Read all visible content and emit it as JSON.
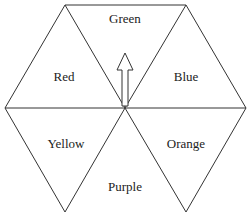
{
  "diagram": {
    "type": "hexagon-of-triangles",
    "colors": {
      "line": "#333333",
      "text": "#222222",
      "background": "#ffffff"
    },
    "regions": [
      {
        "id": "green",
        "label": "Green",
        "x": 125,
        "y": 18
      },
      {
        "id": "red",
        "label": "Red",
        "x": 64,
        "y": 76
      },
      {
        "id": "blue",
        "label": "Blue",
        "x": 186,
        "y": 76
      },
      {
        "id": "yellow",
        "label": "Yellow",
        "x": 66,
        "y": 143
      },
      {
        "id": "orange",
        "label": "Orange",
        "x": 186,
        "y": 143
      },
      {
        "id": "purple",
        "label": "Purple",
        "x": 125,
        "y": 186
      }
    ],
    "arrow": {
      "direction": "up",
      "points_to": "Green",
      "origin": "center"
    }
  }
}
